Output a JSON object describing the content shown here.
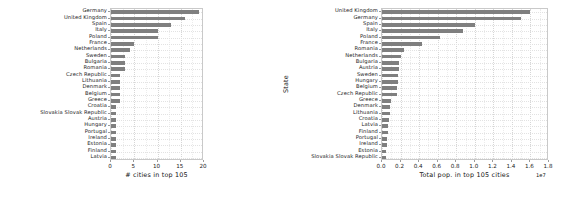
{
  "figure": {
    "background": "#ffffff",
    "bar_color": "#7f7f7f",
    "grid_color": "#d6d6d6",
    "axes_color": "#c9c9c9"
  },
  "chart_data": [
    {
      "type": "bar",
      "orientation": "horizontal",
      "panel": "left",
      "title": "",
      "xlabel": "# cities in top 105",
      "ylabel": "",
      "xlim": [
        0,
        20
      ],
      "xticks": [
        0,
        5,
        10,
        15,
        20
      ],
      "xticklabels": [
        "0",
        "5",
        "10",
        "15",
        "20"
      ],
      "grid": true,
      "legend": "none",
      "categories": [
        "Latvia",
        "Finland",
        "Estonia",
        "Ireland",
        "Portugal",
        "Hungary",
        "Austria",
        "Slovakia Slovak Republic",
        "Croatia",
        "Greece",
        "Belgium",
        "Denmark",
        "Lithuania",
        "Czech Republic",
        "Romania",
        "Bulgaria",
        "Sweden",
        "Netherlands",
        "France",
        "Poland",
        "Italy",
        "Spain",
        "United Kingdom",
        "Germany"
      ],
      "values": [
        1,
        1,
        1,
        1,
        1,
        1,
        1,
        1,
        1,
        2,
        2,
        2,
        2,
        2,
        3,
        3,
        3,
        4,
        5,
        10,
        10,
        13,
        16,
        19
      ]
    },
    {
      "type": "bar",
      "orientation": "horizontal",
      "panel": "right",
      "title": "",
      "xlabel": "Total pop. in top 105 cities",
      "ylabel": "State",
      "exponent_label": "1e7",
      "xlim": [
        0,
        18000000
      ],
      "xticks": [
        0,
        2000000,
        4000000,
        6000000,
        8000000,
        10000000,
        12000000,
        14000000,
        16000000,
        18000000
      ],
      "xticklabels": [
        "0.0",
        "0.2",
        "0.4",
        "0.6",
        "0.8",
        "1.0",
        "1.2",
        "1.4",
        "1.6",
        "1.8"
      ],
      "grid": true,
      "legend": "none",
      "categories": [
        "Slovakia Slovak Republic",
        "Estonia",
        "Ireland",
        "Portugal",
        "Finland",
        "Latvia",
        "Croatia",
        "Lithuania",
        "Denmark",
        "Greece",
        "Czech Republic",
        "Belgium",
        "Hungary",
        "Sweden",
        "Austria",
        "Bulgaria",
        "Netherlands",
        "Romania",
        "France",
        "Poland",
        "Italy",
        "Spain",
        "Germany",
        "United Kingdom"
      ],
      "values": [
        430000,
        440000,
        550000,
        560000,
        640000,
        700000,
        800000,
        850000,
        880000,
        980000,
        1600000,
        1650000,
        1700000,
        1720000,
        1780000,
        1800000,
        2050000,
        2350000,
        4300000,
        6200000,
        8700000,
        10000000,
        15000000,
        15900000
      ]
    }
  ]
}
